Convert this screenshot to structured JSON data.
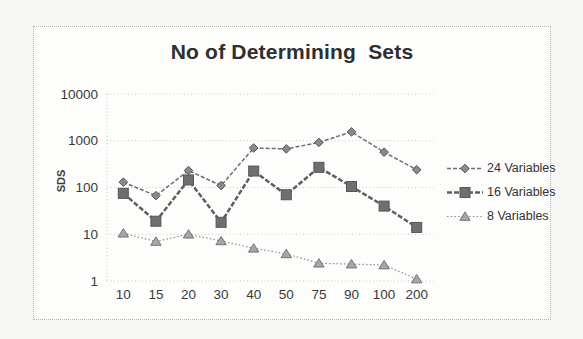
{
  "figure": {
    "frame_style": "dotted-border",
    "background": "#fdfdfc"
  },
  "chart_data": {
    "type": "line",
    "title": "No of Determining  Sets",
    "xlabel": "",
    "ylabel": "SDS",
    "y_scale": "log",
    "ylim": [
      1,
      10000
    ],
    "y_ticks": [
      "1",
      "10",
      "100",
      "1000",
      "10000"
    ],
    "grid": "horizontal-dotted",
    "legend_position": "right",
    "categories": [
      "10",
      "15",
      "20",
      "30",
      "40",
      "50",
      "75",
      "90",
      "100",
      "200"
    ],
    "series": [
      {
        "name": "24 Variables",
        "marker": "diamond",
        "line_style": "dashed",
        "values": [
          130,
          67,
          230,
          110,
          700,
          670,
          920,
          1550,
          570,
          240
        ]
      },
      {
        "name": "16 Variables",
        "marker": "square",
        "line_style": "dashed-thick",
        "values": [
          75,
          19,
          145,
          18,
          225,
          70,
          270,
          105,
          40,
          14
        ]
      },
      {
        "name": "8 Variables",
        "marker": "triangle",
        "line_style": "dotted",
        "values": [
          10.5,
          7,
          10,
          7.2,
          5,
          3.8,
          2.4,
          2.3,
          2.2,
          1.1
        ]
      }
    ],
    "colors": {
      "series_line": "#6e6e6e",
      "series_line_dark": "#5f5f5f",
      "marker_fill": "#8a8a8a",
      "marker_stroke": "#565656",
      "grid": "#c9c9c8",
      "tick_text": "#3a3a3a",
      "title_text": "#2f2f2f"
    }
  }
}
